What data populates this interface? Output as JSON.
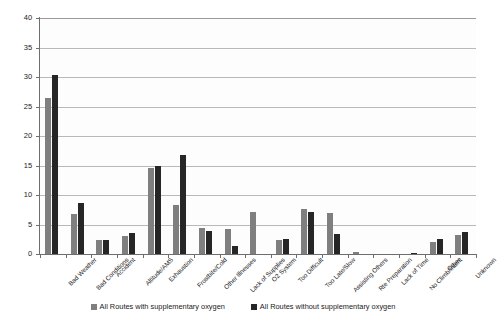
{
  "chart_data": {
    "type": "bar",
    "title": "",
    "xlabel": "",
    "ylabel": "",
    "ylim": [
      0,
      40
    ],
    "ytick_values": [
      0,
      5,
      10,
      15,
      20,
      25,
      30,
      35,
      40
    ],
    "ytick_labels": [
      "0",
      "5",
      "10",
      "15",
      "20",
      "25",
      "30",
      "35",
      "40"
    ],
    "grid": true,
    "legend_position": "bottom",
    "categories": [
      "Bad Weather",
      "Bad Conditions",
      "Accident",
      "Altitude/AMS",
      "Exhaustion",
      "Frostbite/Cold",
      "Other Illnesses",
      "Lack of Supplies",
      "O2 System",
      "Too Difficult",
      "Too Late/Slow",
      "Assisting Others",
      "Rte Preparation",
      "Lack of Time",
      "No Climb/Intent",
      "Other",
      "Unknown"
    ],
    "series": [
      {
        "name": "All Routes with supplementary oxygen",
        "color": "#7f7f7f",
        "values": [
          26.5,
          6.8,
          2.4,
          3.0,
          14.6,
          8.3,
          4.4,
          4.2,
          7.2,
          2.4,
          7.7,
          7.0,
          0.3,
          0.0,
          0.0,
          2.1,
          3.2
        ]
      },
      {
        "name": "All Routes without supplementary oxygen",
        "color": "#262626",
        "values": [
          30.4,
          8.6,
          2.4,
          3.6,
          14.9,
          16.8,
          3.9,
          1.4,
          0.0,
          2.6,
          7.2,
          3.4,
          0.0,
          0.0,
          0.2,
          2.6,
          3.8
        ]
      }
    ]
  },
  "legend": {
    "items": [
      {
        "label": "All Routes with supplementary oxygen",
        "color": "#7f7f7f"
      },
      {
        "label": "All Routes without supplementary oxygen",
        "color": "#262626"
      }
    ]
  }
}
